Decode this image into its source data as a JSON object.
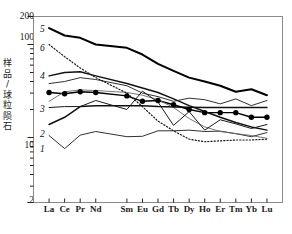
{
  "chart_data": {
    "type": "line",
    "title": "",
    "xlabel": "",
    "ylabel": "样品/球粒陨石",
    "ylabel_chars": [
      "样",
      "品",
      "/",
      "球",
      "粒",
      "陨",
      "石"
    ],
    "yscale": "log",
    "ylim": [
      2,
      200
    ],
    "ytick_labels": [
      "200",
      "100",
      "10",
      "2"
    ],
    "ytick_values": [
      200,
      100,
      10,
      2
    ],
    "grid": false,
    "legend": "inline-curve-numbers",
    "categories": [
      "La",
      "Ce",
      "Pr",
      "Nd",
      "Sm",
      "Eu",
      "Gd",
      "Tb",
      "Dy",
      "Ho",
      "Er",
      "Tm",
      "Yb",
      "Lu"
    ],
    "series": [
      {
        "name": "1",
        "label": "1",
        "style": "solid-thin",
        "values": [
          10.5,
          7.6,
          10.6,
          11.6,
          10.2,
          10.3,
          11.8,
          11.8,
          12.0,
          11.6,
          11.7,
          11.0,
          10.2,
          11.3
        ]
      },
      {
        "name": "2",
        "label": "2",
        "style": "solid-medium",
        "values": [
          13.8,
          16.5,
          21.5,
          22.0,
          22.0,
          22.0,
          21.5,
          21.3,
          21.2,
          21.0,
          21.0,
          21.0,
          21.0,
          21.0
        ]
      },
      {
        "name": "3",
        "label": "3",
        "style": "solid-circles",
        "marker": "filled-circle",
        "values": [
          30.5,
          29.5,
          31.0,
          30.5,
          28.0,
          24.5,
          25.0,
          22.5,
          20.0,
          18.5,
          18.5,
          18.5,
          16.5,
          16.5
        ]
      },
      {
        "name": "3b",
        "label": "",
        "style": "solid-thin-gray",
        "values": [
          24.5,
          31.0,
          32.5,
          32.0,
          30.5,
          28.5,
          25.5,
          21.0,
          16.0,
          13.0,
          11.6,
          11.0,
          10.5,
          9.8
        ]
      },
      {
        "name": "4",
        "label": "4",
        "style": "solid-medium",
        "values": [
          46.0,
          50.0,
          51.0,
          46.0,
          38.0,
          34.0,
          30.5,
          26.0,
          22.0,
          19.0,
          16.5,
          14.5,
          13.0,
          12.0
        ]
      },
      {
        "name": "5",
        "label": "5",
        "style": "solid-thick",
        "values": [
          150.0,
          125.0,
          118.0,
          100.0,
          92.0,
          78.0,
          62.0,
          52.0,
          44.0,
          40.0,
          36.0,
          31.0,
          33.0,
          28.5
        ]
      },
      {
        "name": "5b",
        "label": "",
        "style": "solid-thin",
        "values": [
          38.0,
          40.0,
          44.0,
          42.0,
          36.0,
          30.0,
          27.5,
          24.5,
          26.5,
          25.5,
          23.0,
          26.0,
          22.0,
          25.0
        ]
      },
      {
        "name": "6",
        "label": "6",
        "style": "dotted",
        "values": [
          100.0,
          74.0,
          56.0,
          44.0,
          30.0,
          21.5,
          15.0,
          11.8,
          9.6,
          9.0,
          9.2,
          9.4,
          9.4,
          9.6
        ]
      },
      {
        "name": "7",
        "label": "",
        "style": "solid-zigzag",
        "values": [
          21.0,
          21.5,
          21.5,
          25.0,
          20.0,
          31.5,
          24.0,
          13.5,
          19.0,
          12.0,
          15.5,
          14.0,
          12.5,
          13.8
        ]
      }
    ],
    "curve_labels": [
      {
        "text": "5",
        "x": 40,
        "y": 24
      },
      {
        "text": "6",
        "x": 40,
        "y": 43
      },
      {
        "text": "4",
        "x": 40,
        "y": 71
      },
      {
        "text": "3",
        "x": 40,
        "y": 104
      },
      {
        "text": "2",
        "x": 40,
        "y": 129
      },
      {
        "text": "1",
        "x": 40,
        "y": 144
      }
    ]
  }
}
